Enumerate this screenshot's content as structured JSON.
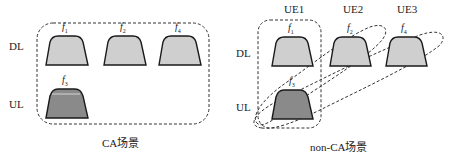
{
  "left_panel": {
    "caption": "CA场景",
    "row_labels": {
      "dl": "DL",
      "ul": "UL"
    },
    "dl_carriers": [
      {
        "f": "f",
        "sub": "1"
      },
      {
        "f": "f",
        "sub": "2"
      },
      {
        "f": "f",
        "sub": "4"
      }
    ],
    "ul_carriers": [
      {
        "f": "f",
        "sub": "3"
      }
    ]
  },
  "right_panel": {
    "caption": "non-CA场景",
    "column_labels": [
      "UE1",
      "UE2",
      "UE3"
    ],
    "row_labels": {
      "dl": "DL",
      "ul": "UL"
    },
    "dl_carriers": [
      {
        "f": "f",
        "sub": "1"
      },
      {
        "f": "f",
        "sub": "2"
      },
      {
        "f": "f",
        "sub": "4"
      }
    ],
    "ul_carriers": [
      {
        "f": "f",
        "sub": "3"
      }
    ]
  },
  "colors": {
    "dl_fill": "#cfcfcf",
    "ul_fill": "#8a8a8a",
    "stroke": "#1a1a1a",
    "dash": "#333333"
  }
}
